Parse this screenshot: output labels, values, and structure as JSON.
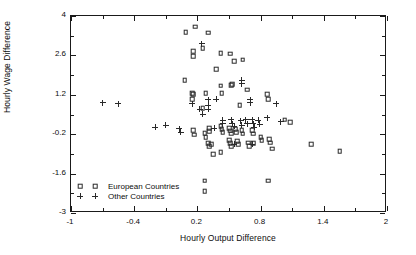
{
  "chart_data": {
    "type": "scatter",
    "title": "",
    "xlabel": "Hourly Output Difference",
    "ylabel": "Hourly Wage Difference",
    "xlim": [
      -1,
      2
    ],
    "ylim": [
      -3,
      4
    ],
    "xticks": [
      "-1",
      "-0.4",
      "0.2",
      "0.8",
      "1.4",
      "2"
    ],
    "xtick_values": [
      -1,
      -0.4,
      0.2,
      0.8,
      1.4,
      2
    ],
    "yticks": [
      "4",
      "2.6",
      "1.2",
      "-0.2",
      "-1.6",
      "-3"
    ],
    "ytick_values": [
      4,
      2.6,
      1.2,
      -0.2,
      -1.6,
      -3
    ],
    "grid": false,
    "legend_position": "lower left",
    "series": [
      {
        "name": "European Countries",
        "marker": "square",
        "color": "#2a2a2a",
        "points": [
          [
            0.09,
            3.42
          ],
          [
            0.18,
            3.62
          ],
          [
            0.3,
            3.4
          ],
          [
            0.16,
            2.75
          ],
          [
            0.16,
            2.58
          ],
          [
            0.25,
            2.86
          ],
          [
            0.42,
            2.68
          ],
          [
            0.51,
            2.66
          ],
          [
            0.55,
            2.4
          ],
          [
            0.63,
            2.45
          ],
          [
            0.08,
            1.72
          ],
          [
            0.38,
            2.12
          ],
          [
            0.42,
            1.52
          ],
          [
            0.52,
            1.55
          ],
          [
            0.53,
            1.58
          ],
          [
            0.67,
            1.38
          ],
          [
            0.15,
            1.25
          ],
          [
            0.16,
            1.22
          ],
          [
            0.28,
            1.25
          ],
          [
            0.43,
            1.25
          ],
          [
            0.15,
            1.05
          ],
          [
            0.86,
            1.22
          ],
          [
            0.87,
            1.05
          ],
          [
            0.25,
            0.72
          ],
          [
            0.6,
            0.82
          ],
          [
            0.16,
            -0.05
          ],
          [
            0.17,
            -0.22
          ],
          [
            0.31,
            0.02
          ],
          [
            0.31,
            -0.1
          ],
          [
            0.42,
            0.08
          ],
          [
            0.43,
            -0.02
          ],
          [
            0.44,
            -0.12
          ],
          [
            0.5,
            0.02
          ],
          [
            0.51,
            -0.08
          ],
          [
            0.52,
            -0.18
          ],
          [
            0.56,
            -0.02
          ],
          [
            0.57,
            -0.12
          ],
          [
            0.62,
            -0.05
          ],
          [
            0.63,
            -0.18
          ],
          [
            0.72,
            -0.05
          ],
          [
            0.73,
            -0.18
          ],
          [
            0.27,
            -0.16
          ],
          [
            0.28,
            -0.3
          ],
          [
            0.3,
            -0.52
          ],
          [
            0.31,
            -0.62
          ],
          [
            0.33,
            -0.55
          ],
          [
            0.5,
            -0.42
          ],
          [
            0.51,
            -0.52
          ],
          [
            0.52,
            -0.62
          ],
          [
            0.58,
            -0.45
          ],
          [
            0.59,
            -0.55
          ],
          [
            0.68,
            -0.5
          ],
          [
            0.69,
            -0.62
          ],
          [
            0.73,
            -0.52
          ],
          [
            0.8,
            -0.3
          ],
          [
            0.81,
            -0.42
          ],
          [
            0.88,
            -0.38
          ],
          [
            0.89,
            -0.5
          ],
          [
            0.91,
            -0.72
          ],
          [
            0.35,
            -0.92
          ],
          [
            0.42,
            -0.85
          ],
          [
            1.03,
            0.32
          ],
          [
            1.08,
            0.22
          ],
          [
            1.28,
            -0.55
          ],
          [
            1.55,
            -0.8
          ],
          [
            0.27,
            -1.85
          ],
          [
            0.27,
            -2.22
          ],
          [
            0.87,
            -1.85
          ]
        ]
      },
      {
        "name": "Other Countries",
        "marker": "plus",
        "color": "#2a2a2a",
        "points": [
          [
            -0.7,
            0.92
          ],
          [
            -0.55,
            0.88
          ],
          [
            -0.2,
            0.05
          ],
          [
            -0.1,
            0.12
          ],
          [
            0.03,
            0.0
          ],
          [
            0.04,
            -0.12
          ],
          [
            0.15,
            0.88
          ],
          [
            0.22,
            0.68
          ],
          [
            0.3,
            1.02
          ],
          [
            0.3,
            0.82
          ],
          [
            0.3,
            0.68
          ],
          [
            0.38,
            1.05
          ],
          [
            0.25,
            0.52
          ],
          [
            0.36,
            0.02
          ],
          [
            0.44,
            0.3
          ],
          [
            0.44,
            0.18
          ],
          [
            0.52,
            0.32
          ],
          [
            0.53,
            0.18
          ],
          [
            0.55,
            0.08
          ],
          [
            0.61,
            0.28
          ],
          [
            0.62,
            0.12
          ],
          [
            0.66,
            0.32
          ],
          [
            0.67,
            0.18
          ],
          [
            0.7,
            1.02
          ],
          [
            0.7,
            0.92
          ],
          [
            0.72,
            0.32
          ],
          [
            0.73,
            0.18
          ],
          [
            0.74,
            0.05
          ],
          [
            0.78,
            0.3
          ],
          [
            0.79,
            0.15
          ],
          [
            0.86,
            0.38
          ],
          [
            0.95,
            0.88
          ],
          [
            0.62,
            1.72
          ],
          [
            0.62,
            1.6
          ],
          [
            0.24,
            3.02
          ],
          [
            0.99,
            0.25
          ],
          [
            0.72,
            -0.55
          ],
          [
            0.55,
            -0.55
          ]
        ]
      }
    ]
  },
  "legend": {
    "items": [
      {
        "label": "European Countries",
        "marker": "square"
      },
      {
        "label": "Other Countries",
        "marker": "plus"
      }
    ]
  }
}
